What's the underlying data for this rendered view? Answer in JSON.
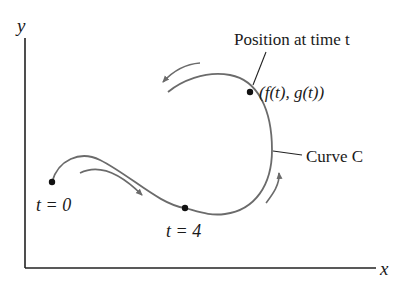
{
  "diagram": {
    "axes": {
      "x_label": "x",
      "y_label": "y"
    },
    "labels": {
      "position_caption": "Position at time t",
      "position_point": "(f(t), g(t))",
      "curve_name": "Curve C",
      "start_point": "t = 0",
      "t4_point": "t = 4"
    },
    "points": [
      {
        "name": "t0",
        "label": "t = 0",
        "x": 52,
        "y": 182
      },
      {
        "name": "t4",
        "label": "t = 4",
        "x": 185,
        "y": 208
      },
      {
        "name": "position",
        "label": "(f(t), g(t))",
        "x": 250,
        "y": 92
      }
    ],
    "direction_arrows": 3,
    "colors": {
      "curve": "#6b6b6b",
      "axes": "#222222",
      "points": "#111111",
      "text": "#1a1a1a"
    }
  }
}
